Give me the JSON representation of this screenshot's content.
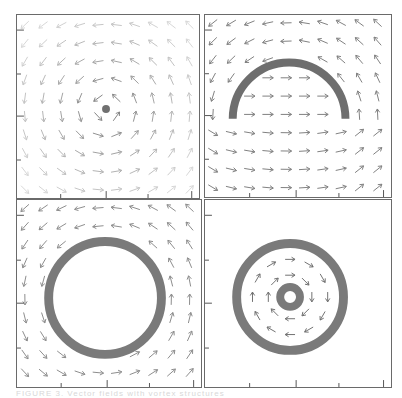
{
  "figure": {
    "caption": "FIGURE 3.  Vector fields with vortex structures",
    "panels": [
      {
        "id": "a",
        "position": "top-left",
        "description": "Point vortex at center with counter-clockwise circulating field",
        "arrow_color": "#b0b0b0",
        "core_color": "#707070",
        "structure": "point",
        "center": [
          0.5,
          0.5
        ]
      },
      {
        "id": "b",
        "position": "top-right",
        "description": "Half-ring (semicircular arc) vortex sheet; arrows flow right inside the arc and circulate around",
        "arrow_color": "#808080",
        "core_color": "#6e6e6e",
        "structure": "semicircle"
      },
      {
        "id": "c",
        "position": "bottom-left",
        "description": "Full ring vortex sheet with field circulating outside, empty interior",
        "arrow_color": "#8c8c8c",
        "core_color": "#7a7a7a",
        "structure": "ring"
      },
      {
        "id": "d",
        "position": "bottom-right",
        "description": "Outer ring plus inner small ring with clockwise circulation in between; no field outside",
        "arrow_color": "#707070",
        "core_color": "#7a7a7a",
        "structure": "double-ring"
      }
    ],
    "axes": {
      "x_ticks_count": 4,
      "y_ticks_count": 4,
      "tick_labels": []
    },
    "colors": {
      "frame": "#6a6a6a",
      "background": "#ffffff"
    }
  }
}
